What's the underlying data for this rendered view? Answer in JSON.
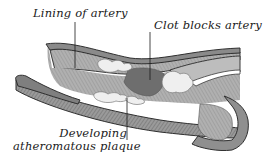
{
  "diagram": {
    "labels": [
      {
        "id": "lining",
        "text": "Lining of artery"
      },
      {
        "id": "clot",
        "text": "Clot blocks artery"
      },
      {
        "id": "plaque_line1",
        "text": "Developing"
      },
      {
        "id": "plaque_line2",
        "text": "atheromatous plaque"
      }
    ],
    "colors": {
      "wall_outer": "#7a7a7a",
      "wall_edge": "#3a3a3a",
      "lining": "#a8a8a8",
      "clot": "#6e6e6e",
      "plaque": "#ededed",
      "background": "#ffffff"
    }
  }
}
